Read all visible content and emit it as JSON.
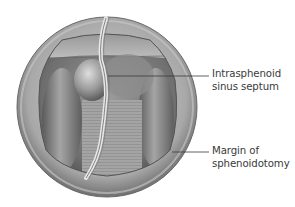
{
  "figure": {
    "labels": [
      {
        "line1": "Intrasphenoid",
        "line2": "sinus septum"
      },
      {
        "line1": "Margin of",
        "line2": "sphenoidotomy"
      }
    ],
    "colors": {
      "background": "#ffffff",
      "leader_line": "#3a3a3a",
      "text": "#3a3a3a"
    }
  }
}
